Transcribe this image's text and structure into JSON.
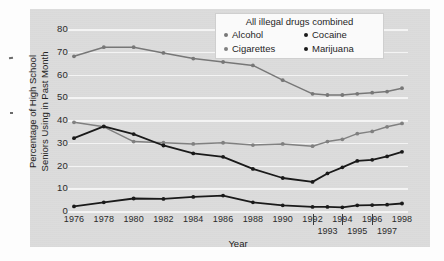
{
  "chart_data": {
    "type": "line",
    "title": "",
    "xlabel": "Year",
    "ylabel_line1": "Percentage of High School",
    "ylabel_line2": "Seniors Using in Past Month",
    "ylim": [
      0,
      80
    ],
    "yticks": [
      80,
      70,
      60,
      50,
      40,
      30,
      20,
      10,
      0
    ],
    "grid": true,
    "legend_position": "top-right",
    "legend_title": "All illegal drugs combined",
    "x": [
      1976,
      1977,
      1978,
      1979,
      1980,
      1981,
      1982,
      1983,
      1984,
      1985,
      1986,
      1987,
      1988,
      1989,
      1990,
      1991,
      1992,
      1993,
      1994,
      1995,
      1996,
      1997,
      1998
    ],
    "xticks_top": [
      "1976",
      "1978",
      "1980",
      "1982",
      "1984",
      "1986",
      "1988",
      "1990",
      "1992",
      "1994",
      "1996",
      "1998"
    ],
    "xticks_bottom": [
      "1993",
      "1995",
      "1997"
    ],
    "series": [
      {
        "name": "Alcohol",
        "color": "#777777",
        "x": [
          1976,
          1978,
          1980,
          1982,
          1984,
          1986,
          1988,
          1990,
          1992,
          1993,
          1994,
          1995,
          1996,
          1997,
          1998
        ],
        "values": [
          68.0,
          72.0,
          72.0,
          69.5,
          67.0,
          65.5,
          64.0,
          57.5,
          51.5,
          51.0,
          51.0,
          51.5,
          52.0,
          52.5,
          54.0
        ]
      },
      {
        "name": "Cigarettes",
        "color": "#808080",
        "x": [
          1976,
          1978,
          1980,
          1982,
          1984,
          1986,
          1988,
          1990,
          1992,
          1993,
          1994,
          1995,
          1996,
          1997,
          1998
        ],
        "values": [
          39.0,
          37.0,
          30.5,
          30.0,
          29.5,
          30.0,
          29.0,
          29.5,
          28.5,
          30.5,
          31.5,
          34.0,
          35.0,
          37.0,
          38.5
        ]
      },
      {
        "name": "Marijuana",
        "color": "#1a1a1a",
        "x": [
          1976,
          1978,
          1980,
          1982,
          1984,
          1986,
          1988,
          1990,
          1992,
          1993,
          1994,
          1995,
          1996,
          1997,
          1998
        ],
        "values": [
          32.0,
          37.2,
          33.8,
          28.8,
          25.3,
          23.8,
          18.5,
          14.5,
          12.8,
          16.5,
          19.2,
          22.0,
          22.5,
          24.0,
          26.0
        ]
      },
      {
        "name": "Cocaine",
        "color": "#1a1a1a",
        "x": [
          1976,
          1978,
          1980,
          1982,
          1984,
          1986,
          1988,
          1990,
          1992,
          1993,
          1994,
          1995,
          1996,
          1997,
          1998
        ],
        "values": [
          2.0,
          3.8,
          5.5,
          5.3,
          6.2,
          6.8,
          3.8,
          2.5,
          1.8,
          1.8,
          1.6,
          2.5,
          2.6,
          2.8,
          3.3
        ]
      }
    ],
    "legend_entries": [
      {
        "label": "Alcohol",
        "color": "#777777"
      },
      {
        "label": "Cocaine",
        "color": "#1a1a1a"
      },
      {
        "label": "Cigarettes",
        "color": "#808080"
      },
      {
        "label": "Marijuana",
        "color": "#1a1a1a"
      }
    ]
  }
}
